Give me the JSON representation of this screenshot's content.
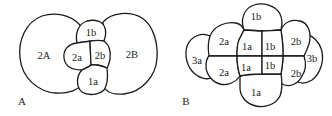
{
  "figure": {
    "panels": [
      {
        "id": "A",
        "label": "A",
        "cells": [
          {
            "label": "2A"
          },
          {
            "label": "2B"
          },
          {
            "label": "1b"
          },
          {
            "label": "2a"
          },
          {
            "label": "2b"
          },
          {
            "label": "1a"
          }
        ]
      },
      {
        "id": "B",
        "label": "B",
        "cells": [
          {
            "label": "1b"
          },
          {
            "label": "2a"
          },
          {
            "label": "1a"
          },
          {
            "label": "1b"
          },
          {
            "label": "2b"
          },
          {
            "label": "3a"
          },
          {
            "label": "3b"
          },
          {
            "label": "2a"
          },
          {
            "label": "1a"
          },
          {
            "label": "1b"
          },
          {
            "label": "2b"
          },
          {
            "label": "1a"
          }
        ]
      }
    ]
  }
}
